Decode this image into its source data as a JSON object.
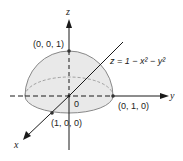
{
  "diagram": {
    "type": "3d-surface-sketch",
    "surface": {
      "name": "hemisphere-paraboloid",
      "equation": "z = 1 − x² − y²",
      "fill_color": "#e9e9e9",
      "stroke_color": "#888888"
    },
    "axes": {
      "x": {
        "label": "x"
      },
      "y": {
        "label": "y"
      },
      "z": {
        "label": "z"
      }
    },
    "origin_label": "0",
    "points": [
      {
        "id": "top",
        "label": "(0, 0, 1)"
      },
      {
        "id": "y-intercept",
        "label": "(0, 1, 0)"
      },
      {
        "id": "x-intercept",
        "label": "(1, 0, 0)"
      }
    ],
    "colors": {
      "axis": "#1a1a1a",
      "point": "#333333"
    }
  }
}
